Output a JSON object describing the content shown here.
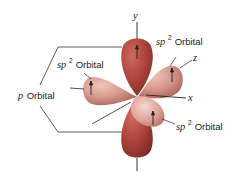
{
  "diagram": {
    "axes": {
      "y": "y",
      "z": "z",
      "x": "x"
    },
    "labels": {
      "sp2_top_right": {
        "prefix": "sp",
        "superscript": "2",
        "suffix": " Orbital"
      },
      "sp2_left": {
        "prefix": "sp",
        "superscript": "2",
        "suffix": " Orbital"
      },
      "sp2_bottom_right": {
        "prefix": "sp",
        "superscript": "2",
        "suffix": " Orbital"
      },
      "p_orbital": {
        "prefix": "p",
        "suffix": " Orbital"
      }
    },
    "colors": {
      "p_lobe": "#b0463e",
      "p_lobe_dark": "#7e2a25",
      "sp2_lobe": "#d99a8e",
      "sp2_lobe_dark": "#a8605a",
      "line": "#333333"
    }
  }
}
